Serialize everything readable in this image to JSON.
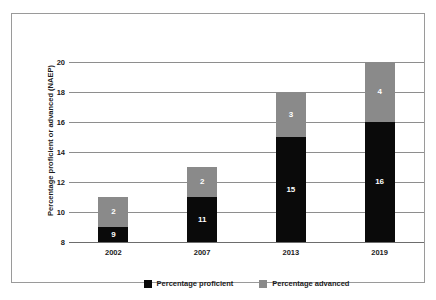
{
  "chart_data": {
    "type": "bar",
    "subtype": "stacked-bar",
    "title": "",
    "xlabel": "",
    "ylabel": "Percentage proficient or advanced (NAEP)",
    "categories": [
      "2002",
      "2007",
      "2013",
      "2019"
    ],
    "series": [
      {
        "name": "Percentage proficient",
        "color": "#0a0a0a",
        "values": [
          9,
          11,
          15,
          16
        ]
      },
      {
        "name": "Percentage advanced",
        "color": "#8a8a8a",
        "values": [
          2,
          2,
          3,
          4
        ]
      }
    ],
    "totals": [
      11,
      13,
      18,
      20
    ],
    "ylim": [
      8,
      20
    ],
    "yticks": [
      8,
      10,
      12,
      14,
      16,
      18,
      20
    ],
    "ytick_labels": [
      "8",
      "10",
      "12",
      "14",
      "16",
      "18",
      "20"
    ],
    "grid": true,
    "legend_position": "bottom"
  },
  "axes": {
    "y_title": "Percentage proficient or advanced (NAEP)",
    "y_ticks": [
      {
        "value": 20,
        "label": "20"
      },
      {
        "value": 18,
        "label": "18"
      },
      {
        "value": 16,
        "label": "16"
      },
      {
        "value": 14,
        "label": "14"
      },
      {
        "value": 12,
        "label": "12"
      },
      {
        "value": 10,
        "label": "10"
      },
      {
        "value": 8,
        "label": "8"
      }
    ],
    "x_ticks": [
      {
        "label": "2002"
      },
      {
        "label": "2007"
      },
      {
        "label": "2013"
      },
      {
        "label": "2019"
      }
    ]
  },
  "bars": [
    {
      "category": "2002",
      "proficient": {
        "value": 9,
        "label": "9"
      },
      "advanced": {
        "value": 2,
        "label": "2"
      },
      "total": 11
    },
    {
      "category": "2007",
      "proficient": {
        "value": 11,
        "label": "11"
      },
      "advanced": {
        "value": 2,
        "label": "2"
      },
      "total": 13
    },
    {
      "category": "2013",
      "proficient": {
        "value": 15,
        "label": "15"
      },
      "advanced": {
        "value": 3,
        "label": "3"
      },
      "total": 18
    },
    {
      "category": "2019",
      "proficient": {
        "value": 16,
        "label": "16"
      },
      "advanced": {
        "value": 4,
        "label": "4"
      },
      "total": 20
    }
  ],
  "legend": {
    "items": [
      {
        "label": "Percentage proficient",
        "color": "#0a0a0a"
      },
      {
        "label": "Percentage advanced",
        "color": "#8a8a8a"
      }
    ]
  },
  "colors": {
    "proficient": "#0a0a0a",
    "advanced": "#8a8a8a",
    "gridline": "#8e8e8e",
    "frame": "#9a9a9a",
    "text": "#1b1b1b",
    "background": "#ffffff"
  }
}
